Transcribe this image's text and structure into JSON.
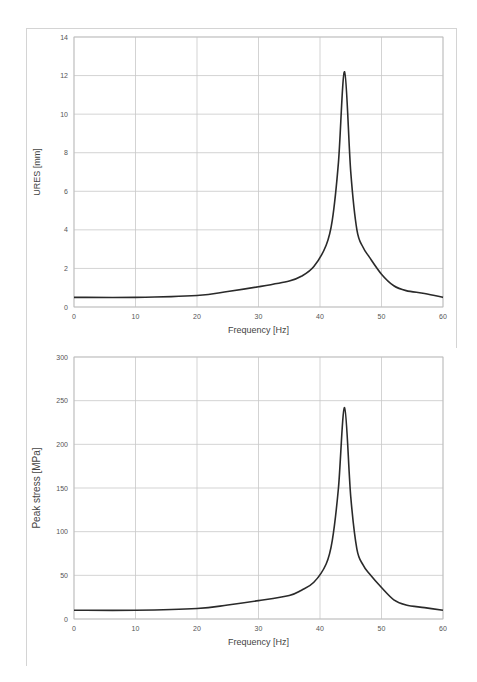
{
  "chart_data": [
    {
      "type": "line",
      "title": "",
      "xlabel": "Frequency [Hz]",
      "ylabel": "URES [mm]",
      "xlim": [
        0,
        60
      ],
      "ylim": [
        0,
        14
      ],
      "xticks": [
        0,
        10,
        20,
        30,
        40,
        50,
        60
      ],
      "yticks": [
        0,
        2,
        4,
        6,
        8,
        10,
        12,
        14
      ],
      "grid": true,
      "legend": null,
      "series": [
        {
          "name": "URES",
          "color": "#2a2a2a",
          "x": [
            0,
            10,
            20,
            25,
            30,
            35,
            37,
            39,
            41,
            42,
            43,
            44,
            45,
            46,
            47,
            48,
            50,
            52,
            54,
            57,
            60
          ],
          "y": [
            0.5,
            0.5,
            0.6,
            0.8,
            1.05,
            1.35,
            1.6,
            2.1,
            3.2,
            4.5,
            7.5,
            12.2,
            7.0,
            4.0,
            3.1,
            2.6,
            1.7,
            1.1,
            0.85,
            0.7,
            0.5
          ]
        }
      ]
    },
    {
      "type": "line",
      "title": "",
      "xlabel": "Frequency [Hz]",
      "ylabel": "Peak stress [MPa]",
      "xlim": [
        0,
        60
      ],
      "ylim": [
        0,
        300
      ],
      "xticks": [
        0,
        10,
        20,
        30,
        40,
        50,
        60
      ],
      "yticks": [
        0,
        50,
        100,
        150,
        200,
        250,
        300
      ],
      "grid": true,
      "legend": null,
      "series": [
        {
          "name": "Peak stress",
          "color": "#2a2a2a",
          "x": [
            0,
            10,
            20,
            25,
            30,
            35,
            37,
            39,
            41,
            42,
            43,
            44,
            45,
            46,
            47,
            48,
            50,
            52,
            54,
            57,
            60
          ],
          "y": [
            10,
            10,
            12,
            16,
            21,
            27,
            33,
            42,
            63,
            90,
            150,
            242,
            140,
            80,
            62,
            52,
            36,
            22,
            16,
            13,
            10
          ]
        }
      ]
    }
  ]
}
